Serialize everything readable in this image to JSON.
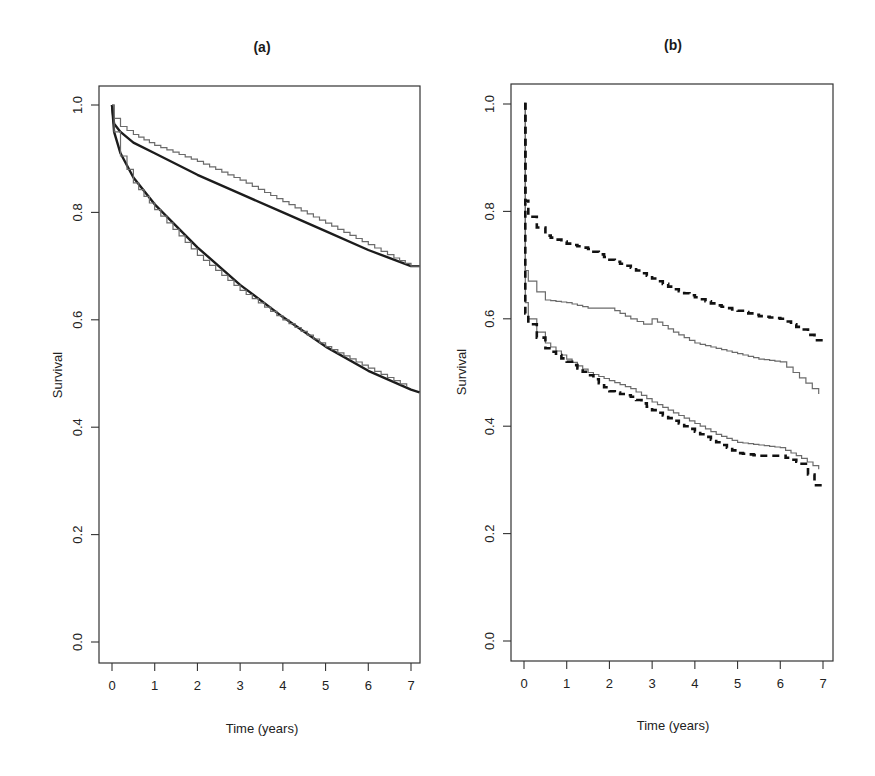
{
  "chart_data": [
    {
      "type": "line",
      "panel": "a",
      "title": "(a)",
      "xlabel": "Time (years)",
      "ylabel": "Survival",
      "xlim": [
        0,
        7.2
      ],
      "ylim": [
        0.0,
        1.0
      ],
      "xticks": [
        "0",
        "1",
        "2",
        "3",
        "4",
        "5",
        "6",
        "7"
      ],
      "yticks": [
        "0.0",
        "0.2",
        "0.4",
        "0.6",
        "0.8",
        "1.0"
      ],
      "grid": false,
      "legend": null,
      "series": [
        {
          "name": "upper group (fitted)",
          "style": "thick",
          "x": [
            0,
            0.05,
            0.2,
            0.5,
            1,
            2,
            3,
            4,
            5,
            6,
            7,
            7.2
          ],
          "values": [
            1.0,
            0.965,
            0.95,
            0.93,
            0.91,
            0.87,
            0.835,
            0.8,
            0.765,
            0.73,
            0.7,
            0.7
          ]
        },
        {
          "name": "upper group (observed)",
          "style": "thin",
          "x": [
            0,
            0.05,
            0.2,
            0.5,
            1,
            2,
            3,
            4,
            5,
            6,
            6.6,
            7,
            7.2
          ],
          "values": [
            1.0,
            0.975,
            0.96,
            0.945,
            0.925,
            0.895,
            0.86,
            0.82,
            0.78,
            0.74,
            0.715,
            0.7,
            0.7
          ]
        },
        {
          "name": "lower group (fitted)",
          "style": "thick",
          "x": [
            0,
            0.05,
            0.2,
            0.5,
            1,
            2,
            3,
            4,
            5,
            6,
            7,
            7.2
          ],
          "values": [
            1.0,
            0.95,
            0.91,
            0.865,
            0.815,
            0.735,
            0.665,
            0.605,
            0.55,
            0.505,
            0.47,
            0.465
          ]
        },
        {
          "name": "lower group (observed)",
          "style": "thin",
          "x": [
            0,
            0.05,
            0.2,
            0.5,
            1,
            2,
            3,
            4,
            5,
            6,
            6.9
          ],
          "values": [
            1.0,
            0.95,
            0.905,
            0.855,
            0.805,
            0.72,
            0.655,
            0.6,
            0.55,
            0.51,
            0.475
          ]
        }
      ]
    },
    {
      "type": "line",
      "panel": "b",
      "title": "(b)",
      "xlabel": "Time (years)",
      "ylabel": "Survival",
      "xlim": [
        0,
        7.2
      ],
      "ylim": [
        0.0,
        1.0
      ],
      "xticks": [
        "0",
        "1",
        "2",
        "3",
        "4",
        "5",
        "6",
        "7"
      ],
      "yticks": [
        "0.0",
        "0.2",
        "0.4",
        "0.6",
        "0.8",
        "1.0"
      ],
      "grid": false,
      "legend": null,
      "series": [
        {
          "name": "group 1 (fitted)",
          "style": "dashed",
          "x": [
            0,
            0.03,
            0.1,
            0.3,
            0.5,
            1,
            1.5,
            2,
            2.5,
            3,
            3.5,
            4,
            4.5,
            5,
            5.5,
            6,
            6.5,
            6.8,
            7.0
          ],
          "values": [
            1.0,
            0.82,
            0.79,
            0.77,
            0.755,
            0.74,
            0.73,
            0.71,
            0.695,
            0.675,
            0.655,
            0.64,
            0.625,
            0.615,
            0.605,
            0.6,
            0.58,
            0.56,
            0.56
          ]
        },
        {
          "name": "group 1 (observed)",
          "style": "thin",
          "x": [
            0,
            0.03,
            0.1,
            0.3,
            0.5,
            1,
            1.5,
            2,
            2.5,
            2.8,
            3,
            3.5,
            4,
            4.5,
            5,
            5.5,
            6,
            6.3,
            6.6,
            6.9
          ],
          "values": [
            1.0,
            0.69,
            0.67,
            0.65,
            0.635,
            0.63,
            0.62,
            0.62,
            0.6,
            0.59,
            0.6,
            0.575,
            0.555,
            0.545,
            0.535,
            0.525,
            0.52,
            0.5,
            0.48,
            0.46
          ]
        },
        {
          "name": "group 2 (observed)",
          "style": "thin",
          "x": [
            0,
            0.03,
            0.1,
            0.3,
            0.5,
            1,
            1.5,
            2,
            2.5,
            3,
            3.5,
            4,
            4.5,
            5,
            5.5,
            6,
            6.5,
            6.9
          ],
          "values": [
            1.0,
            0.63,
            0.6,
            0.575,
            0.555,
            0.525,
            0.5,
            0.485,
            0.47,
            0.445,
            0.425,
            0.405,
            0.385,
            0.37,
            0.365,
            0.36,
            0.34,
            0.32
          ]
        },
        {
          "name": "group 2 (fitted)",
          "style": "dashed",
          "x": [
            0,
            0.03,
            0.1,
            0.3,
            0.5,
            1,
            1.5,
            2,
            2.5,
            3,
            3.5,
            4,
            4.5,
            5,
            5.5,
            6,
            6.5,
            6.8,
            7.0
          ],
          "values": [
            1.0,
            0.61,
            0.59,
            0.565,
            0.545,
            0.52,
            0.495,
            0.465,
            0.455,
            0.43,
            0.41,
            0.39,
            0.37,
            0.35,
            0.345,
            0.345,
            0.33,
            0.29,
            0.29
          ]
        }
      ]
    }
  ],
  "panels": {
    "a": {
      "title": "(a)",
      "xlabel": "Time (years)",
      "ylabel": "Survival"
    },
    "b": {
      "title": "(b)",
      "xlabel": "Time (years)",
      "ylabel": "Survival"
    }
  }
}
